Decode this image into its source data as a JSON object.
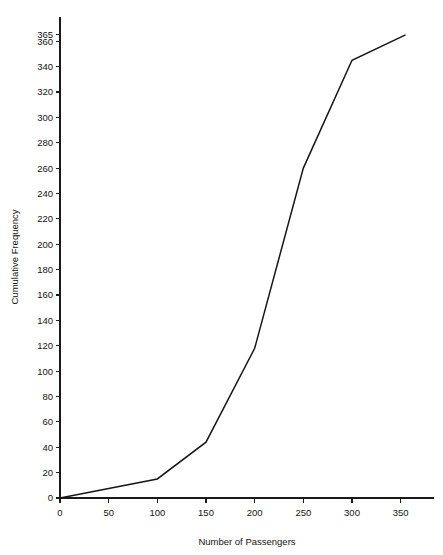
{
  "chart_data": {
    "type": "line",
    "title": "",
    "subtitle": "",
    "xlabel": "Number of Passengers",
    "ylabel": "Cumulative Frequency",
    "xlim": [
      0,
      375
    ],
    "ylim": [
      0,
      372
    ],
    "grid": false,
    "legend": "none",
    "xticks": [
      0,
      50,
      100,
      150,
      200,
      250,
      300,
      350
    ],
    "xtick_labels": [
      "0",
      "50",
      "100",
      "150",
      "200",
      "250",
      "300",
      "350"
    ],
    "yticks": [
      0,
      20,
      40,
      60,
      80,
      100,
      120,
      140,
      160,
      180,
      200,
      220,
      240,
      260,
      280,
      300,
      320,
      340,
      360,
      365
    ],
    "ytick_labels": [
      "0",
      "20",
      "40",
      "60",
      "80",
      "100",
      "120",
      "140",
      "160",
      "180",
      "200",
      "220",
      "240",
      "260",
      "280",
      "300",
      "320",
      "340",
      "360",
      "365"
    ],
    "series": [
      {
        "name": "Cumulative Frequency",
        "color": "#161616",
        "x": [
          0,
          100,
          150,
          200,
          250,
          300,
          355
        ],
        "values": [
          0,
          15,
          44,
          118,
          260,
          345,
          365
        ]
      }
    ],
    "annotations": []
  },
  "axes": {
    "x_title": "Number of Passengers",
    "y_title": "Cumulative Frequency"
  }
}
